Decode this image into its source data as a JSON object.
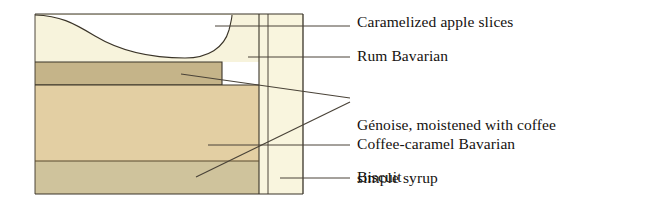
{
  "figure": {
    "type": "layered-cross-section"
  },
  "diagram": {
    "geometry": {
      "left": 35,
      "top": 14,
      "right": 303,
      "bottom": 194,
      "body_right": 259,
      "coating_left": 268
    },
    "layers": [
      {
        "key": "apple",
        "name": "Caramelized apple slices",
        "fill": "#ffffff",
        "top": 14,
        "bottom": 62
      },
      {
        "key": "rum_bavarian",
        "name": "Rum Bavarian",
        "fill": "#f7f3dc",
        "top": 14,
        "bottom": 62
      },
      {
        "key": "genoise",
        "name": "Génoise",
        "fill": "#c5b489",
        "top": 62,
        "bottom": 85
      },
      {
        "key": "coffee_caramel_bavarian",
        "name": "Coffee-caramel Bavarian",
        "fill": "#e3cfa3",
        "top": 85,
        "bottom": 161
      },
      {
        "key": "biscuit",
        "name": "Biscuit",
        "fill": "#cfc39c",
        "top": 161,
        "bottom": 194
      },
      {
        "key": "coating",
        "name": "Outer coating",
        "fill": "#f9f5de",
        "top": 14,
        "bottom": 194
      }
    ],
    "colors": {
      "outline": "#3a3428",
      "leader": "#4a4338",
      "apple_fill": "#ffffff",
      "rum_bavarian_fill": "#f7f3dc",
      "genoise_fill": "#c5b489",
      "coffee_caramel_fill": "#e3cfa3",
      "biscuit_fill": "#cfc39c",
      "coating_fill": "#f9f5de",
      "background": "#ffffff",
      "text": "#15120f"
    }
  },
  "labels": {
    "apple": "Caramelized apple slices",
    "rum": "Rum Bavarian",
    "genoise_line1": "Génoise, moistened with coffee",
    "genoise_line2": "simple syrup",
    "coffee": "Coffee-caramel Bavarian",
    "biscuit": "Biscuit"
  }
}
